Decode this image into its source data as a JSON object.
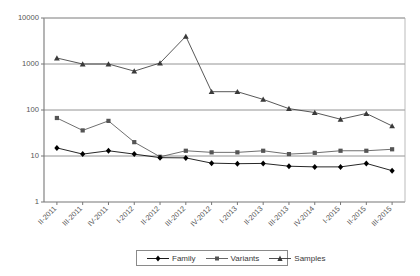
{
  "chart_data": {
    "type": "line",
    "title": "",
    "subtitle": "",
    "xlabel": "",
    "ylabel": "",
    "yscale": "log",
    "ylim": [
      1,
      10000
    ],
    "y_ticks": [
      1,
      10,
      100,
      1000,
      10000
    ],
    "y_tick_labels": [
      "1",
      "10",
      "100",
      "1000",
      "10000"
    ],
    "grid": "horizontal",
    "legend_position": "bottom-center",
    "categories": [
      "II-2011",
      "III-2011",
      "IV-2011",
      "I-2012",
      "II-2012",
      "III-2012",
      "IV-2012",
      "I-2013",
      "II-2013",
      "III-2013",
      "IV-2014",
      "I-2015",
      "II-2015",
      "III-2015"
    ],
    "series": [
      {
        "name": "Family",
        "marker": "diamond",
        "color": "#000000",
        "values": [
          15,
          11,
          13,
          11,
          9.2,
          9.1,
          7,
          6.8,
          6.9,
          6,
          5.8,
          5.8,
          6.9,
          4.8
        ]
      },
      {
        "name": "Variants",
        "marker": "square",
        "color": "#555555",
        "values": [
          67,
          36,
          58,
          20,
          9.6,
          13,
          12,
          12,
          13,
          11,
          11.7,
          13,
          13,
          14
        ]
      },
      {
        "name": "Samples",
        "marker": "triangle",
        "color": "#3a3a3a",
        "values": [
          1350,
          1000,
          1000,
          700,
          1050,
          4000,
          250,
          250,
          170,
          107,
          88,
          63,
          84,
          45
        ]
      }
    ]
  },
  "legend": {
    "items": [
      {
        "label": "Family"
      },
      {
        "label": "Variants"
      },
      {
        "label": "Samples"
      }
    ]
  }
}
